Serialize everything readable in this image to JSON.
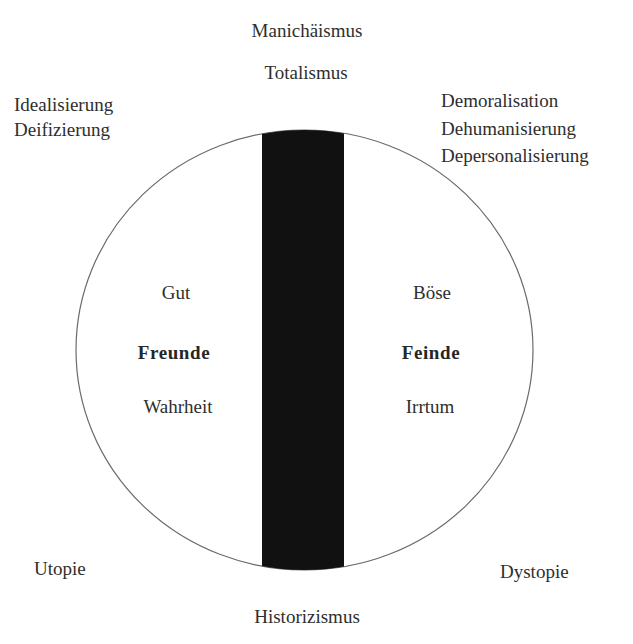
{
  "diagram": {
    "shape": "ellipse-divided-by-bar",
    "colors": {
      "background": "#ffffff",
      "outline": "#6a6a6a",
      "divider": "#111111",
      "text": "#2e2e2e"
    },
    "top": {
      "line1": "Manichäismus",
      "line2": "Totalismus"
    },
    "top_left": {
      "lines": [
        "Idealisierung",
        "Deifizierung"
      ]
    },
    "top_right": {
      "lines": [
        "Demoralisation",
        "Dehumanisierung",
        "Depersonalisierung"
      ]
    },
    "left_half": {
      "upper": "Gut",
      "main": "Freunde",
      "lower": "Wahrheit"
    },
    "right_half": {
      "upper": "Böse",
      "main": "Feinde",
      "lower": "Irrtum"
    },
    "bottom_left": "Utopie",
    "bottom_right": "Dystopie",
    "bottom": "Historizismus"
  }
}
